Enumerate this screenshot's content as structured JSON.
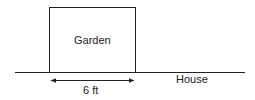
{
  "diagram": {
    "garden_label": "Garden",
    "house_label": "House",
    "dimension_label": "6 ft",
    "stroke_color": "#222222",
    "background_color": "#ffffff"
  }
}
